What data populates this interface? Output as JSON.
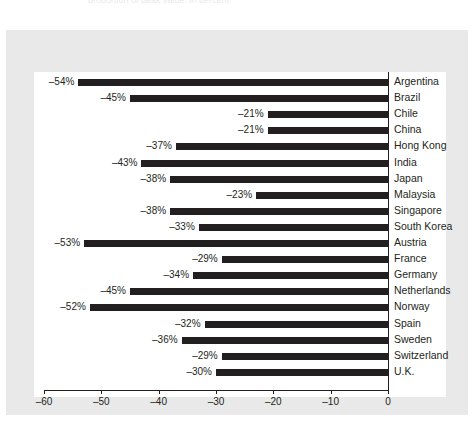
{
  "figure": {
    "caption_sliver": "proportion of peak value, in percent"
  },
  "chart_data": {
    "type": "bar",
    "orientation": "horizontal",
    "title": "",
    "subtitle": "",
    "xlabel": "",
    "ylabel": "",
    "xlim": [
      -60,
      0
    ],
    "xticks": [
      -60,
      -50,
      -40,
      -30,
      -20,
      -10,
      0
    ],
    "xticklabels": [
      "–60",
      "–50",
      "–40",
      "–30",
      "–20",
      "–10",
      "0"
    ],
    "grid": false,
    "legend": false,
    "bar_color": "#231f20",
    "plot_background": "#ffffff",
    "panel_background": "#e9e9e9",
    "categories": [
      "Argentina",
      "Brazil",
      "Chile",
      "China",
      "Hong Kong",
      "India",
      "Japan",
      "Malaysia",
      "Singapore",
      "South Korea",
      "Austria",
      "France",
      "Germany",
      "Netherlands",
      "Norway",
      "Spain",
      "Sweden",
      "Switzerland",
      "U.K."
    ],
    "values": [
      -54,
      -45,
      -21,
      -21,
      -37,
      -43,
      -38,
      -23,
      -38,
      -33,
      -53,
      -29,
      -34,
      -45,
      -52,
      -32,
      -36,
      -29,
      -30
    ],
    "value_labels": [
      "–54%",
      "–45%",
      "–21%",
      "–21%",
      "–37%",
      "–43%",
      "–38%",
      "–23%",
      "–38%",
      "–33%",
      "–53%",
      "–29%",
      "–34%",
      "–45%",
      "–52%",
      "–32%",
      "–36%",
      "–29%",
      "–30%"
    ]
  }
}
